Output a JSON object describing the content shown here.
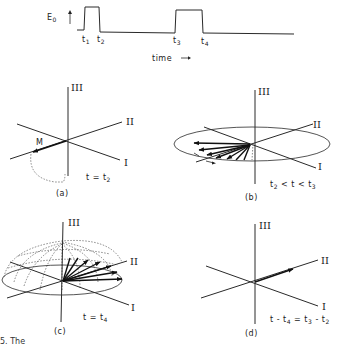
{
  "pulse_sequence": {
    "ylabel": "E",
    "ylabel_sub": "0",
    "xlabel": "time",
    "xlabel_arrow": "→",
    "markers": [
      {
        "label": "t",
        "sub": "1"
      },
      {
        "label": "t",
        "sub": "2"
      },
      {
        "label": "t",
        "sub": "3"
      },
      {
        "label": "t",
        "sub": "4"
      }
    ],
    "pulses": [
      {
        "start": "t1",
        "end": "t2"
      },
      {
        "start": "t3",
        "end": "t4"
      }
    ]
  },
  "axes_labels": {
    "axis1": "I",
    "axis2": "II",
    "axis3": "III"
  },
  "panels": [
    {
      "id": "a",
      "tag": "(a)",
      "condition": "t = t",
      "condition_sub": "2",
      "vector_label": "M"
    },
    {
      "id": "b",
      "tag": "(b)",
      "condition_parts": [
        "t",
        "2",
        " < t < t",
        "3"
      ]
    },
    {
      "id": "c",
      "tag": "(c)",
      "condition": "t = t",
      "condition_sub": "4"
    },
    {
      "id": "d",
      "tag": "(d)",
      "condition_parts": [
        "t - t",
        "4",
        " = t",
        "3",
        " - t",
        "2"
      ]
    }
  ],
  "caption_fragment": "5. The"
}
